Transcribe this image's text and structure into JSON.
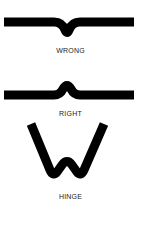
{
  "diagram": {
    "panels": [
      {
        "id": "wrong",
        "label": "WRONG",
        "shape": "flat bar with downward V dip at center"
      },
      {
        "id": "right",
        "label": "RIGHT",
        "shape": "flat bar with upward hump at center"
      },
      {
        "id": "hinge",
        "label": "HINGE",
        "shape": "W-shaped folded strip"
      }
    ],
    "colors": {
      "stroke": "#000000",
      "text": "#222222",
      "background": "#ffffff"
    }
  }
}
